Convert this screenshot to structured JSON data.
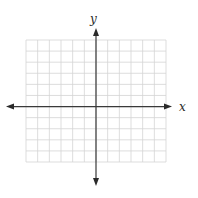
{
  "diagram": {
    "type": "coordinate-plane",
    "x_axis_label": "x",
    "y_axis_label": "y",
    "x_range": [
      -6,
      6
    ],
    "y_range": [
      -5,
      6
    ],
    "grid": true,
    "arrows": [
      "left",
      "right",
      "up",
      "down"
    ],
    "colors": {
      "grid": "#d4d4d4",
      "axis": "#3a3a3a",
      "background": "#ffffff"
    }
  }
}
